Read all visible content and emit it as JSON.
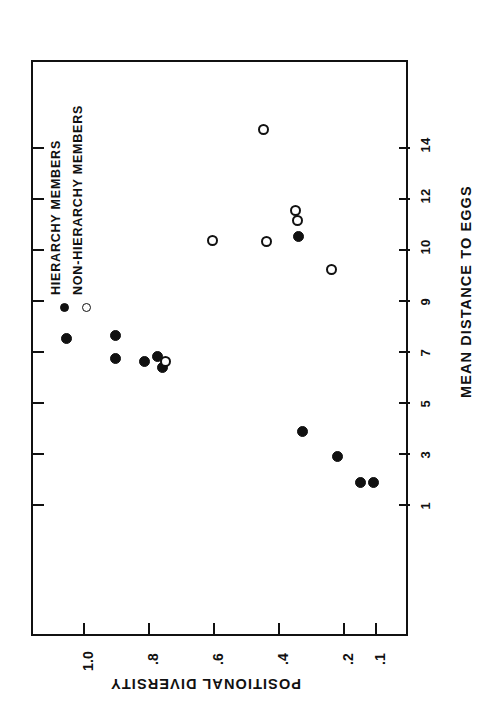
{
  "chart_data": {
    "type": "scatter",
    "title": "",
    "orientation": "rotated-90-ccw",
    "xlabel": "POSITIONAL DIVERSITY",
    "ylabel": "MEAN DISTANCE TO EGGS",
    "xlim": [
      0.05,
      1.08
    ],
    "ylim": [
      0.3,
      15.6
    ],
    "grid": false,
    "legend_position": "upper-left",
    "x_ticks": [
      "1.0",
      ".8",
      ".6",
      ".4",
      ".2",
      ".1"
    ],
    "x_tick_values": [
      1.0,
      0.8,
      0.6,
      0.4,
      0.2,
      0.1
    ],
    "y_ticks": [
      "1",
      "3",
      "5",
      "7",
      "9",
      "10",
      "12",
      "14"
    ],
    "y_tick_values": [
      1,
      3,
      5,
      7,
      9,
      10,
      12,
      14
    ],
    "series": [
      {
        "name": "HIERARCHY MEMBERS",
        "marker": "filled-circle",
        "color": "#111111",
        "points": [
          {
            "x": 1.05,
            "y": 7.5
          },
          {
            "x": 0.9,
            "y": 7.6
          },
          {
            "x": 0.9,
            "y": 6.7
          },
          {
            "x": 0.81,
            "y": 6.6
          },
          {
            "x": 0.77,
            "y": 6.8
          },
          {
            "x": 0.755,
            "y": 6.35
          },
          {
            "x": 0.335,
            "y": 10.5
          },
          {
            "x": 0.325,
            "y": 3.85
          },
          {
            "x": 0.215,
            "y": 2.85
          },
          {
            "x": 0.145,
            "y": 1.85
          },
          {
            "x": 0.105,
            "y": 1.85
          }
        ]
      },
      {
        "name": "NON-HIERARCHY MEMBERS",
        "marker": "open-circle",
        "color": "#111111",
        "points": [
          {
            "x": 0.745,
            "y": 6.6
          },
          {
            "x": 0.6,
            "y": 10.35
          },
          {
            "x": 0.445,
            "y": 14.7
          },
          {
            "x": 0.435,
            "y": 10.3
          },
          {
            "x": 0.345,
            "y": 11.5
          },
          {
            "x": 0.34,
            "y": 11.1
          },
          {
            "x": 0.235,
            "y": 9.6
          }
        ]
      }
    ]
  },
  "legend": {
    "items": [
      {
        "label": "HIERARCHY MEMBERS",
        "marker": "filled-circle"
      },
      {
        "label": "NON-HIERARCHY MEMBERS",
        "marker": "open-circle"
      }
    ]
  },
  "axes": {
    "right": {
      "title": "MEAN DISTANCE TO EGGS",
      "labels": [
        "14",
        "12",
        "10",
        "9",
        "7",
        "5",
        "3",
        "1"
      ]
    },
    "bottom": {
      "title": "POSITIONAL DIVERSITY",
      "labels": [
        "1.0",
        ".8",
        ".6",
        ".4",
        ".2",
        ".1"
      ]
    }
  }
}
